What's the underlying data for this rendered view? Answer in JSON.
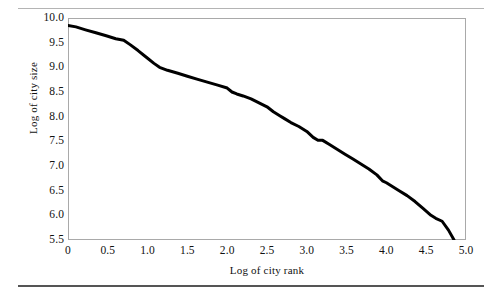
{
  "figure": {
    "top_rule_color": "#b4b4b4",
    "bottom_rule_color": "#555555",
    "background": "#ffffff"
  },
  "chart_data": {
    "type": "line",
    "title": "",
    "subtitle": "",
    "xlabel": "Log of city rank",
    "ylabel": "Log of city size",
    "xlim": [
      0,
      5.0
    ],
    "ylim": [
      5.5,
      10.0
    ],
    "xticks": [
      0,
      0.5,
      1.0,
      1.5,
      2.0,
      2.5,
      3.0,
      3.5,
      4.0,
      4.5,
      5.0
    ],
    "xtick_labels": [
      "0",
      "0.5",
      "1.0",
      "1.5",
      "2.0",
      "2.5",
      "3.0",
      "3.5",
      "4.0",
      "4.5",
      "5.0"
    ],
    "yticks": [
      5.5,
      6.0,
      6.5,
      7.0,
      7.5,
      8.0,
      8.5,
      9.0,
      9.5,
      10.0
    ],
    "ytick_labels": [
      "5.5",
      "6.0",
      "6.5",
      "7.0",
      "7.5",
      "8.0",
      "8.5",
      "9.0",
      "9.5",
      "10.0"
    ],
    "grid": false,
    "legend": null,
    "legend_position": "none",
    "line_color": "#000000",
    "line_width": 3,
    "frame_color": "#a9a9a9",
    "series": [
      {
        "name": "rank-size curve",
        "x": [
          0.0,
          0.1,
          0.22,
          0.35,
          0.48,
          0.6,
          0.7,
          0.78,
          0.88,
          0.98,
          1.08,
          1.15,
          1.25,
          1.38,
          1.5,
          1.62,
          1.75,
          1.88,
          2.0,
          2.06,
          2.12,
          2.2,
          2.3,
          2.4,
          2.5,
          2.58,
          2.66,
          2.72,
          2.8,
          2.9,
          3.0,
          3.08,
          3.14,
          3.2,
          3.28,
          3.38,
          3.48,
          3.58,
          3.68,
          3.78,
          3.88,
          3.95,
          4.0,
          4.08,
          4.16,
          4.26,
          4.36,
          4.46,
          4.56,
          4.62,
          4.7,
          4.78,
          4.85
        ],
        "y": [
          9.85,
          9.82,
          9.76,
          9.7,
          9.64,
          9.58,
          9.55,
          9.46,
          9.34,
          9.21,
          9.08,
          9.0,
          8.94,
          8.88,
          8.82,
          8.76,
          8.7,
          8.64,
          8.58,
          8.5,
          8.46,
          8.42,
          8.36,
          8.28,
          8.2,
          8.1,
          8.02,
          7.96,
          7.88,
          7.8,
          7.7,
          7.58,
          7.52,
          7.52,
          7.44,
          7.34,
          7.24,
          7.14,
          7.04,
          6.94,
          6.82,
          6.7,
          6.66,
          6.58,
          6.5,
          6.4,
          6.28,
          6.14,
          6.0,
          5.94,
          5.88,
          5.7,
          5.5
        ]
      }
    ]
  }
}
